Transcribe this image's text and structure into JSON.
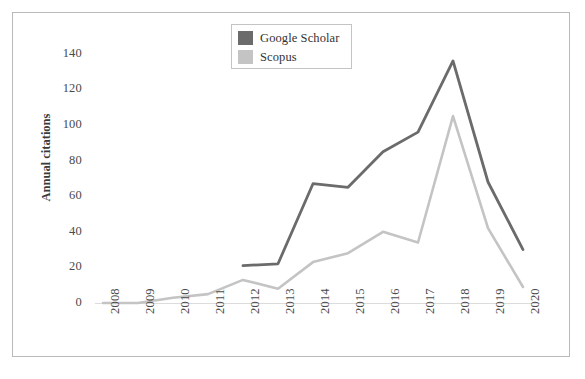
{
  "chart_data": {
    "type": "line",
    "title": "",
    "xlabel": "",
    "ylabel": "Annual citations",
    "categories": [
      "2008",
      "2009",
      "2010",
      "2011",
      "2012",
      "2013",
      "2014",
      "2015",
      "2016",
      "2017",
      "2018",
      "2019",
      "2020"
    ],
    "x": [
      2008,
      2009,
      2010,
      2011,
      2012,
      2013,
      2014,
      2015,
      2016,
      2017,
      2018,
      2019,
      2020
    ],
    "series": [
      {
        "name": "Google Scholar",
        "color": "#6b6b6b",
        "values": [
          null,
          null,
          null,
          null,
          21,
          22,
          67,
          65,
          85,
          96,
          136,
          68,
          30
        ]
      },
      {
        "name": "Scopus",
        "color": "#c4c4c4",
        "values": [
          0,
          0,
          3,
          5,
          13,
          8,
          23,
          28,
          40,
          34,
          105,
          42,
          9
        ]
      }
    ],
    "ylim": [
      0,
      150
    ],
    "yticks": [
      0,
      20,
      40,
      60,
      80,
      100,
      120,
      140
    ],
    "ytick_labels": [
      "0",
      "20",
      "40",
      "60",
      "80",
      "100",
      "120",
      "140"
    ],
    "grid": false,
    "legend_position": "top-center",
    "x_tick_rotation": -90
  },
  "legend": {
    "entries": [
      {
        "label": "Google Scholar",
        "color": "#6b6b6b"
      },
      {
        "label": "Scopus",
        "color": "#c4c4c4"
      }
    ]
  },
  "axes": {
    "y_title": "Annual citations",
    "baseline_color": "#d9d9d9",
    "frame_color": "#b9b9b9"
  }
}
